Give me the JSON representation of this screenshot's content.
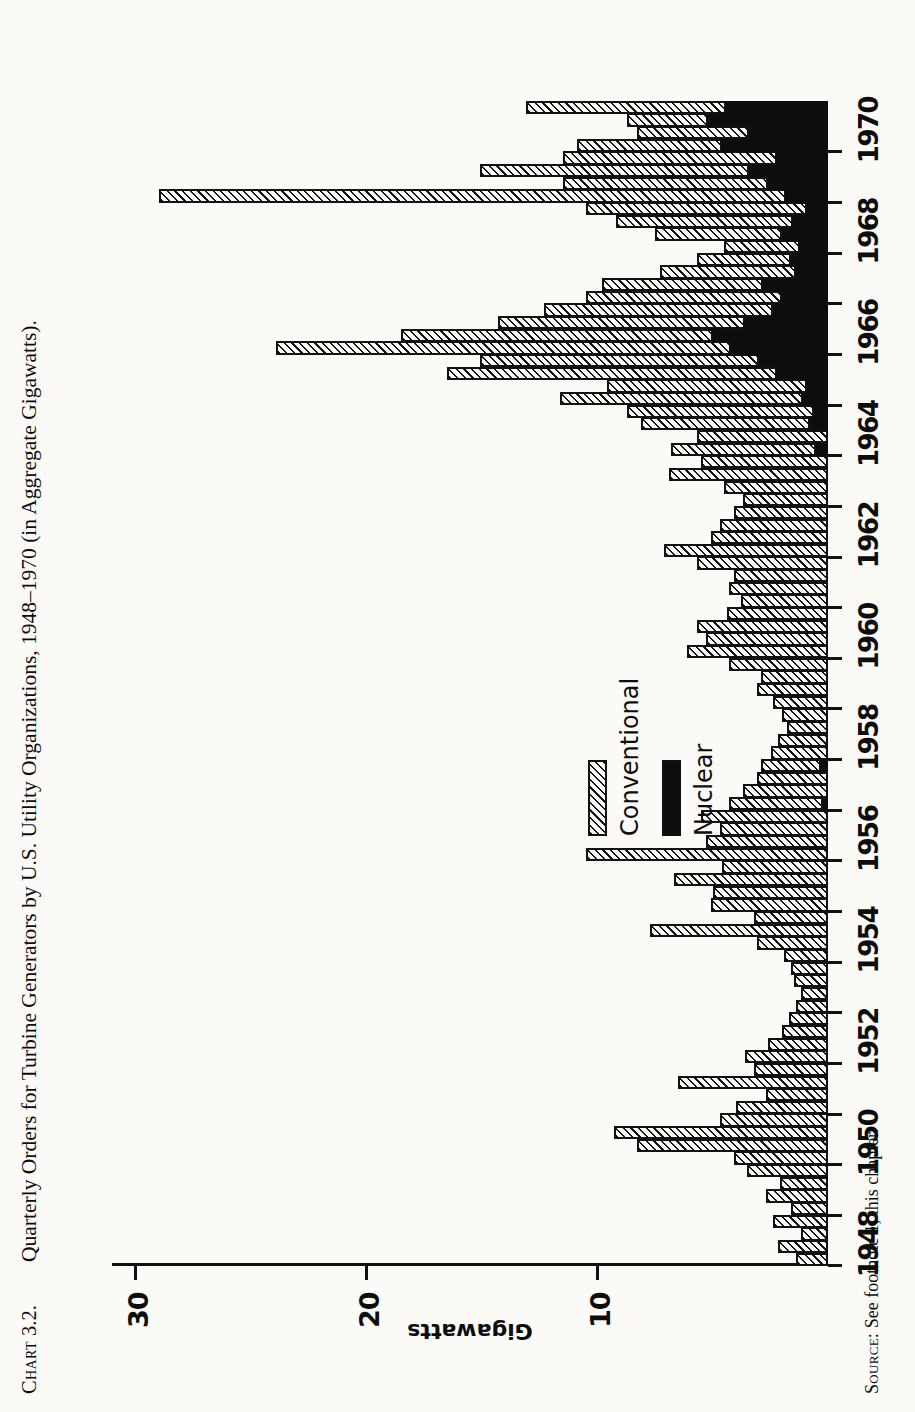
{
  "figure": {
    "number_prefix": "Chart",
    "number": "3.2.",
    "title": "Quarterly Orders for Turbine Generators by U.S. Utility Organizations, 1948–1970 (in Aggregate Gigawatts).",
    "source_prefix": "Source:",
    "source_text": "See footnote 1, this chapter."
  },
  "legend": {
    "position": "plot-interior-left",
    "items": [
      {
        "label": "Conventional",
        "swatch": "hatched",
        "color": "#141414"
      },
      {
        "label": "Nuclear",
        "swatch": "solid",
        "color": "#0d0d0d"
      }
    ]
  },
  "chart_data": {
    "type": "bar",
    "orientation": "vertical-stacked-histogram",
    "title": "Quarterly Orders for Turbine Generators by U.S. Utility Organizations, 1948–1970 (in Aggregate Gigawatts).",
    "xlabel": "",
    "ylabel": "Gigawatts",
    "ylim": [
      0,
      31
    ],
    "yticks": [
      10,
      20,
      30
    ],
    "ytick_labels": [
      "10",
      "20",
      "30"
    ],
    "grid": false,
    "xlim": [
      1948.0,
      1970.75
    ],
    "xticks": [
      1948,
      1949,
      1950,
      1951,
      1952,
      1953,
      1954,
      1955,
      1956,
      1957,
      1958,
      1959,
      1960,
      1961,
      1962,
      1963,
      1964,
      1965,
      1966,
      1967,
      1968,
      1969,
      1970
    ],
    "xtick_labels_shown": [
      "1948",
      "1950",
      "1952",
      "1954",
      "1956",
      "1958",
      "1960",
      "1962",
      "1964",
      "1966",
      "1968",
      "1970"
    ],
    "bar_width_years": 0.25,
    "x": [
      1948.0,
      1948.25,
      1948.5,
      1948.75,
      1949.0,
      1949.25,
      1949.5,
      1949.75,
      1950.0,
      1950.25,
      1950.5,
      1950.75,
      1951.0,
      1951.25,
      1951.5,
      1951.75,
      1952.0,
      1952.25,
      1952.5,
      1952.75,
      1953.0,
      1953.25,
      1953.5,
      1953.75,
      1954.0,
      1954.25,
      1954.5,
      1954.75,
      1955.0,
      1955.25,
      1955.5,
      1955.75,
      1956.0,
      1956.25,
      1956.5,
      1956.75,
      1957.0,
      1957.25,
      1957.5,
      1957.75,
      1958.0,
      1958.25,
      1958.5,
      1958.75,
      1959.0,
      1959.25,
      1959.5,
      1959.75,
      1960.0,
      1960.25,
      1960.5,
      1960.75,
      1961.0,
      1961.25,
      1961.5,
      1961.75,
      1962.0,
      1962.25,
      1962.5,
      1962.75,
      1963.0,
      1963.25,
      1963.5,
      1963.75,
      1964.0,
      1964.25,
      1964.5,
      1964.75,
      1965.0,
      1965.25,
      1965.5,
      1965.75,
      1966.0,
      1966.25,
      1966.5,
      1966.75,
      1967.0,
      1967.25,
      1967.5,
      1967.75,
      1968.0,
      1968.25,
      1968.5,
      1968.75,
      1969.0,
      1969.25,
      1969.5,
      1969.75,
      1970.0,
      1970.25,
      1970.5,
      1970.75
    ],
    "categories_label": "quarter",
    "series": [
      {
        "name": "Nuclear",
        "color": "#0d0d0d",
        "pattern": "solid",
        "stack_order": 0,
        "values": [
          0,
          0,
          0,
          0,
          0,
          0,
          0,
          0,
          0,
          0,
          0,
          0,
          0,
          0,
          0,
          0,
          0,
          0,
          0,
          0,
          0,
          0,
          0,
          0,
          0,
          0,
          0,
          0,
          0,
          0,
          0,
          0,
          0,
          0,
          0,
          0,
          0.2,
          0,
          0,
          0.3,
          0,
          0,
          0,
          0,
          0,
          0,
          0,
          0,
          0,
          0,
          0,
          0,
          0,
          0,
          0,
          0,
          0,
          0,
          0,
          0,
          0,
          0,
          0,
          0,
          0.5,
          0,
          0.8,
          0.6,
          1.1,
          0.9,
          2.2,
          3.0,
          4.2,
          5.0,
          3.6,
          2.4,
          2.0,
          2.8,
          1.4,
          1.6,
          1.2,
          2.0,
          1.5,
          0.9,
          1.8,
          2.6,
          3.4,
          2.2,
          4.6,
          3.4,
          5.2,
          4.4
        ]
      },
      {
        "name": "Conventional",
        "color": "#141414",
        "pattern": "hatched",
        "stack_order": 1,
        "values": [
          1.3,
          2.1,
          1.1,
          2.3,
          1.5,
          2.6,
          2.0,
          3.4,
          4.0,
          8.2,
          9.2,
          4.6,
          3.9,
          2.6,
          6.4,
          3.1,
          3.5,
          2.5,
          1.9,
          1.6,
          1.3,
          1.1,
          1.4,
          1.5,
          1.8,
          3.0,
          7.6,
          3.1,
          5.0,
          4.9,
          6.6,
          4.5,
          10.4,
          5.2,
          4.6,
          5.4,
          4.0,
          3.6,
          3.0,
          2.5,
          2.4,
          2.1,
          1.7,
          1.9,
          2.3,
          3.0,
          2.8,
          4.2,
          6.0,
          5.2,
          5.6,
          4.3,
          3.7,
          4.2,
          4.0,
          5.6,
          7.0,
          5.0,
          4.6,
          4.0,
          3.6,
          4.4,
          6.8,
          5.4,
          6.2,
          5.6,
          7.2,
          8.0,
          10.4,
          8.6,
          14.2,
          12.0,
          19.6,
          13.4,
          10.6,
          9.8,
          8.4,
          6.9,
          5.8,
          4.0,
          3.2,
          5.4,
          7.6,
          9.5,
          27.1,
          8.8,
          11.6,
          9.2,
          6.2,
          4.8,
          3.4,
          8.6
        ]
      }
    ],
    "notes": [
      "Nuclear shown as the lower (black) segment of each stacked quarterly bar.",
      "Conventional shown as the upper hatched segment.",
      "Peak quarterly total of roughly 28 GW occurs in early 1969.",
      "Secondary peak of roughly 24 GW occurs in early 1966."
    ]
  }
}
